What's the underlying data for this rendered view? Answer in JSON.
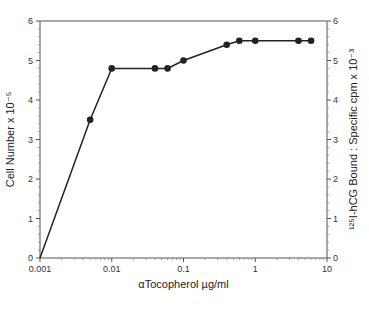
{
  "chart_data": {
    "type": "line",
    "title": "",
    "xlabel": "αTocopherol µg/ml",
    "ylabel": "Cell Number x 10⁻⁵",
    "ylabel_right": "¹²⁵I-hCG Bound : Specific cpm x 10⁻³",
    "xscale": "log",
    "xlim": [
      0.001,
      10
    ],
    "ylim": [
      0,
      6
    ],
    "ylim_right": [
      0,
      6
    ],
    "x_ticks": [
      "0.001",
      "0.01",
      "0.1",
      "1",
      "10"
    ],
    "y_ticks": [
      "0",
      "1",
      "2",
      "3",
      "4",
      "5",
      "6"
    ],
    "y_ticks_right": [
      "0",
      "1",
      "2",
      "3",
      "4",
      "5",
      "6"
    ],
    "grid": false,
    "series": [
      {
        "name": "Cell Number",
        "marker": "filled-circle",
        "color": "#222222",
        "x": [
          0.001,
          0.005,
          0.01,
          0.04,
          0.06,
          0.1,
          0.4,
          0.6,
          1,
          4,
          6
        ],
        "values": [
          0,
          3.5,
          4.8,
          4.8,
          4.8,
          5.0,
          5.4,
          5.5,
          5.5,
          5.5,
          5.5
        ],
        "marker_indices": [
          1,
          2,
          3,
          4,
          5,
          6,
          7,
          8,
          9,
          10
        ]
      }
    ]
  }
}
